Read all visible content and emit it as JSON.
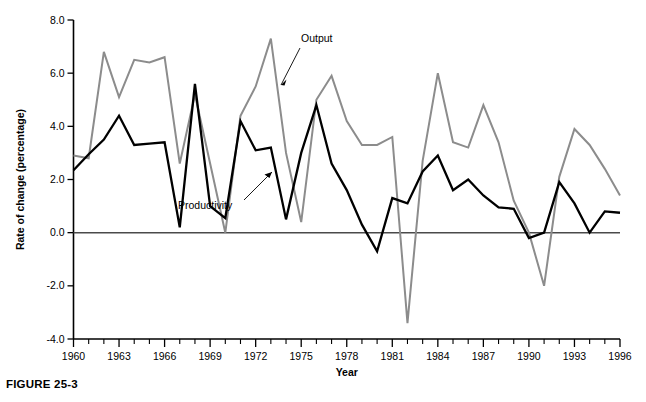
{
  "figure": {
    "caption": "FIGURE 25-3"
  },
  "chart_data": {
    "type": "line",
    "title": "",
    "xlabel": "Year",
    "ylabel": "Rate of change (percentage)",
    "xlim": [
      1960,
      1996
    ],
    "ylim": [
      -4.0,
      8.0
    ],
    "grid": false,
    "legend_position": "inline-annotations",
    "x_tick_labels": [
      "1960",
      "1963",
      "1966",
      "1969",
      "1972",
      "1975",
      "1978",
      "1981",
      "1984",
      "1987",
      "1990",
      "1993",
      "1996"
    ],
    "x_tick_values": [
      1960,
      1963,
      1966,
      1969,
      1972,
      1975,
      1978,
      1981,
      1984,
      1987,
      1990,
      1993,
      1996
    ],
    "x_minor_tick_step": 1,
    "y_tick_labels": [
      "8.0",
      "6.0",
      "4.0",
      "2.0",
      "0.0",
      "-2.0",
      "-4.0"
    ],
    "y_tick_values": [
      8.0,
      6.0,
      4.0,
      2.0,
      0.0,
      -2.0,
      -4.0
    ],
    "x": [
      1960,
      1961,
      1962,
      1963,
      1964,
      1965,
      1966,
      1967,
      1968,
      1969,
      1970,
      1971,
      1972,
      1973,
      1974,
      1975,
      1976,
      1977,
      1978,
      1979,
      1980,
      1981,
      1982,
      1983,
      1984,
      1985,
      1986,
      1987,
      1988,
      1989,
      1990,
      1991,
      1992,
      1993,
      1994,
      1995,
      1996
    ],
    "series": [
      {
        "name": "Output",
        "color": "#8c8c8c",
        "values": [
          2.9,
          2.8,
          6.8,
          5.1,
          6.5,
          6.4,
          6.6,
          2.6,
          5.2,
          2.6,
          0.0,
          4.4,
          5.5,
          7.3,
          3.0,
          0.4,
          5.0,
          5.9,
          4.2,
          3.3,
          3.3,
          3.6,
          -3.4,
          2.7,
          6.0,
          3.4,
          3.2,
          4.8,
          3.4,
          1.2,
          0.0,
          -2.0,
          2.1,
          3.9,
          3.3,
          2.4,
          1.4
        ]
      },
      {
        "name": "Productivity",
        "color": "#000000",
        "values": [
          2.35,
          2.95,
          3.5,
          4.4,
          3.3,
          3.35,
          3.4,
          0.2,
          5.6,
          1.0,
          0.55,
          4.2,
          3.1,
          3.2,
          0.5,
          3.0,
          4.8,
          2.6,
          1.6,
          0.3,
          -0.7,
          1.3,
          1.1,
          2.3,
          2.9,
          1.6,
          2.0,
          1.4,
          0.95,
          0.9,
          -0.2,
          0.0,
          1.9,
          1.1,
          0.0,
          0.8,
          0.75
        ]
      }
    ],
    "annotations": [
      {
        "label": "Output",
        "series": "Output",
        "points_to_year": 1974
      },
      {
        "label": "Productivity",
        "series": "Productivity",
        "points_to_year": 1974
      }
    ]
  }
}
